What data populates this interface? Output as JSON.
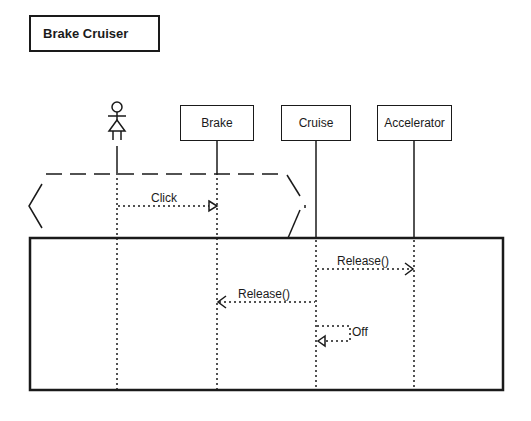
{
  "diagram": {
    "title": "Brake Cruiser",
    "actor": {
      "name": "user-actor"
    },
    "objects": [
      {
        "id": "brake",
        "label": "Brake"
      },
      {
        "id": "cruise",
        "label": "Cruise"
      },
      {
        "id": "accelerator",
        "label": "Accelerator"
      }
    ],
    "messages": [
      {
        "from": "actor",
        "to": "brake",
        "label": "Click",
        "style": "dotted-open-triangle"
      },
      {
        "from": "cruise",
        "to": "accelerator",
        "label": "Release()",
        "style": "dotted-open-arrow"
      },
      {
        "from": "cruise",
        "to": "brake",
        "label": "Release()",
        "style": "dotted-open-arrow"
      },
      {
        "from": "cruise",
        "to": "cruise",
        "label": "Off",
        "style": "dotted-self-triangle"
      }
    ],
    "fragments": [
      {
        "type": "condition-hexagon",
        "covers": [
          "actor",
          "brake"
        ]
      },
      {
        "type": "frame",
        "covers": [
          "actor",
          "brake",
          "cruise",
          "accelerator"
        ]
      }
    ]
  }
}
